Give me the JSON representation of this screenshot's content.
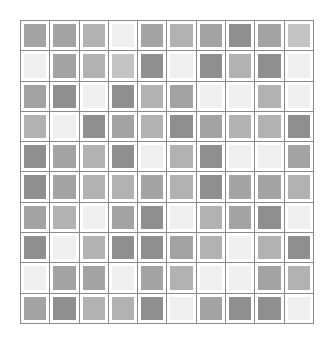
{
  "grid": {
    "rows": 10,
    "cols": 10,
    "palette": [
      "#efefef",
      "#c4c4c4",
      "#b2b2b2",
      "#a3a3a3",
      "#8f8f8f"
    ],
    "cells": [
      [
        3,
        3,
        2,
        0,
        3,
        2,
        3,
        4,
        3,
        1
      ],
      [
        0,
        3,
        2,
        1,
        4,
        0,
        4,
        2,
        4,
        0
      ],
      [
        3,
        4,
        0,
        4,
        2,
        3,
        0,
        0,
        2,
        0
      ],
      [
        2,
        0,
        4,
        3,
        2,
        4,
        3,
        2,
        2,
        4
      ],
      [
        4,
        3,
        2,
        4,
        0,
        2,
        4,
        0,
        0,
        3
      ],
      [
        4,
        3,
        2,
        2,
        3,
        2,
        4,
        3,
        3,
        2
      ],
      [
        3,
        2,
        0,
        3,
        4,
        0,
        2,
        3,
        4,
        0
      ],
      [
        4,
        0,
        2,
        4,
        4,
        3,
        2,
        0,
        2,
        4
      ],
      [
        0,
        3,
        3,
        0,
        3,
        2,
        0,
        0,
        3,
        2
      ],
      [
        3,
        4,
        2,
        2,
        4,
        0,
        3,
        4,
        4,
        0
      ]
    ]
  }
}
